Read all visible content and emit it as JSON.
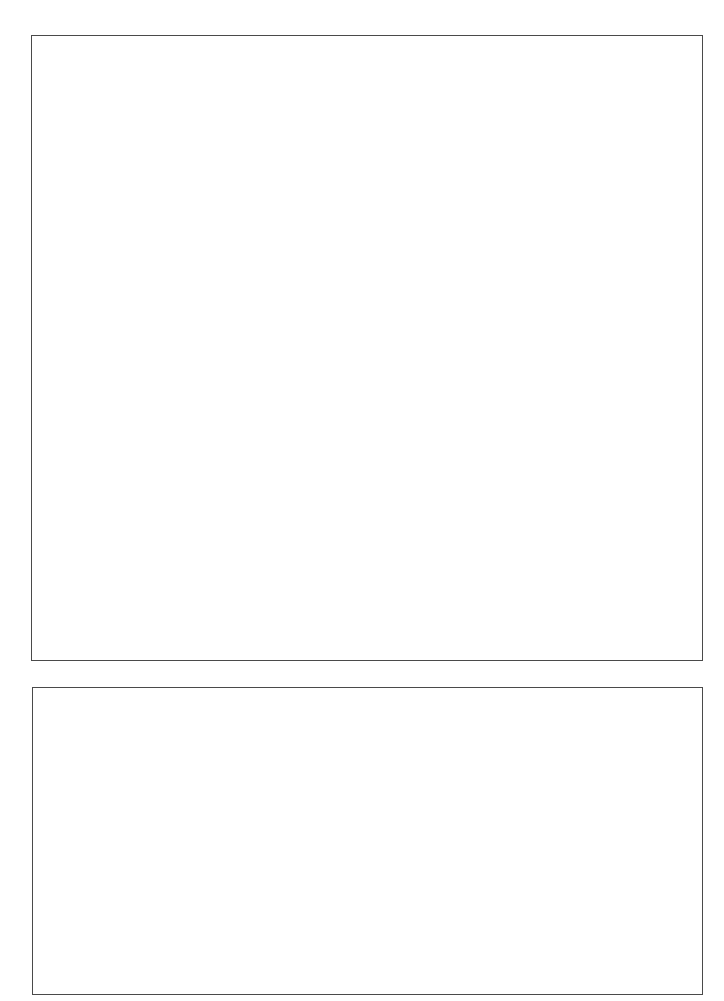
{
  "page": {
    "background": "#ffffff",
    "border_color": "#4a4a4a"
  },
  "frames": [
    {
      "id": "top",
      "content": ""
    },
    {
      "id": "bottom",
      "content": ""
    }
  ]
}
